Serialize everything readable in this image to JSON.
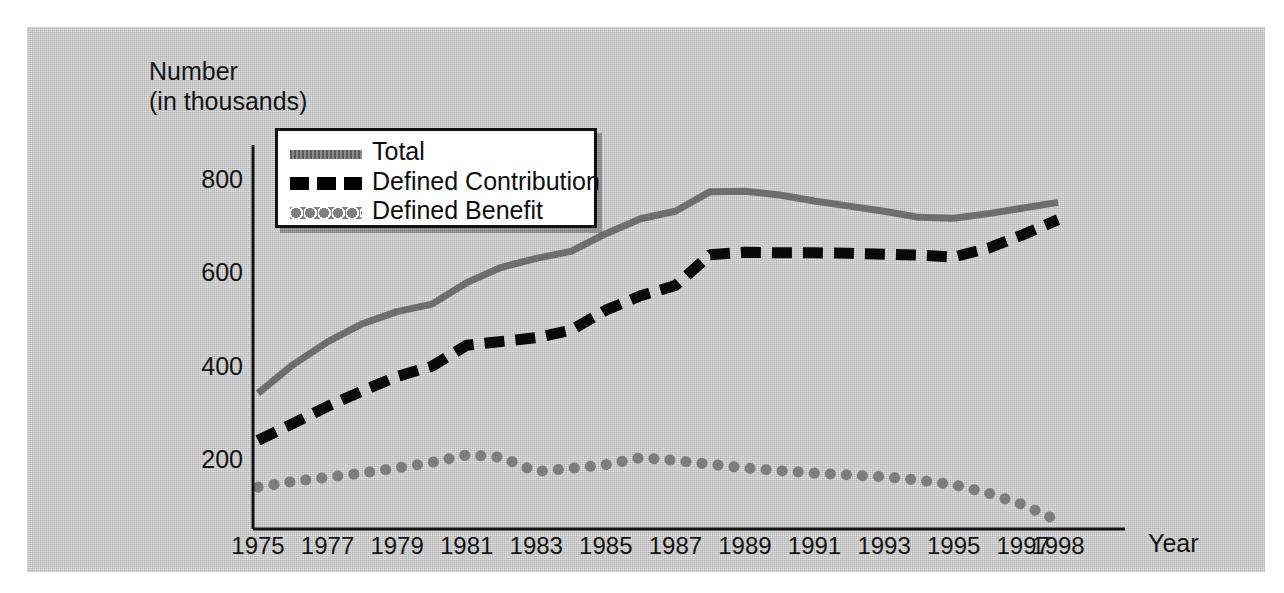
{
  "chart_data": {
    "type": "line",
    "title": "",
    "ylabel": "Number\n(in thousands)",
    "ylabel_line1": "Number",
    "ylabel_line2": "(in thousands)",
    "xlabel": "Year",
    "ylim": [
      0,
      860
    ],
    "xlim": [
      1975,
      1998
    ],
    "yticks": [
      200,
      400,
      600,
      800
    ],
    "ytick_labels": [
      "200",
      "400",
      "600",
      "800"
    ],
    "xtick_labels": [
      "1975",
      "1977",
      "1979",
      "1981",
      "1983",
      "1985",
      "1987",
      "1989",
      "1991",
      "1993",
      "1995",
      "1997",
      "1998"
    ],
    "xtick_years": [
      1975,
      1977,
      1979,
      1981,
      1983,
      1985,
      1987,
      1989,
      1991,
      1993,
      1995,
      1997,
      1998
    ],
    "grid": false,
    "legend_position": "upper-left-inside",
    "x": [
      1975,
      1976,
      1977,
      1978,
      1979,
      1980,
      1981,
      1982,
      1983,
      1984,
      1985,
      1986,
      1987,
      1988,
      1989,
      1990,
      1991,
      1992,
      1993,
      1994,
      1995,
      1996,
      1997,
      1998
    ],
    "series": [
      {
        "name": "Total",
        "style": "solid",
        "color": "#6e6e6e",
        "values": [
          343,
          404,
          453,
          492,
          518,
          534,
          580,
          613,
          632,
          647,
          685,
          717,
          733,
          775,
          776,
          768,
          755,
          744,
          733,
          720,
          718,
          728,
          740,
          752
        ]
      },
      {
        "name": "Defined Contribution",
        "style": "dashed",
        "color": "#0a0a0a",
        "values": [
          242,
          278,
          315,
          348,
          379,
          401,
          446,
          454,
          462,
          478,
          521,
          552,
          574,
          640,
          645,
          644,
          644,
          643,
          641,
          639,
          635,
          654,
          683,
          715
        ]
      },
      {
        "name": "Defined Benefit",
        "style": "dotted",
        "color": "#7d7d7d",
        "values": [
          142,
          154,
          163,
          172,
          183,
          195,
          211,
          206,
          175,
          182,
          190,
          205,
          199,
          191,
          183,
          177,
          172,
          168,
          164,
          157,
          147,
          129,
          104,
          70
        ]
      }
    ]
  },
  "legend": {
    "items": [
      {
        "label": "Total",
        "swatch": "solid-gray-line"
      },
      {
        "label": "Defined Contribution",
        "swatch": "black-dashed-line"
      },
      {
        "label": "Defined Benefit",
        "swatch": "gray-dotted-line"
      }
    ]
  }
}
